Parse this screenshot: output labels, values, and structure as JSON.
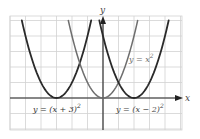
{
  "chart_data": {
    "type": "line",
    "title": "",
    "xlabel": "x",
    "ylabel": "y",
    "xlim": [
      -6,
      5
    ],
    "ylim": [
      -2,
      5.3
    ],
    "grid": true,
    "series": [
      {
        "name": "y = (x + 3)^2",
        "label_text": "y = (x + 3)",
        "exponent": "2",
        "vertex": [
          -3,
          0
        ],
        "shift": -3,
        "color": "#2a2a2a",
        "x_range": [
          -5.236,
          -0.764
        ]
      },
      {
        "name": "y = x^2",
        "label_text": "y = x",
        "exponent": "2",
        "vertex": [
          0,
          0
        ],
        "shift": 0,
        "color": "#6e6e6e",
        "x_range": [
          -2.236,
          2.236
        ]
      },
      {
        "name": "y = (x - 2)^2",
        "label_text": "y = (x − 2)",
        "exponent": "2",
        "vertex": [
          2,
          0
        ],
        "shift": 2,
        "color": "#2a2a2a",
        "x_range": [
          -0.236,
          4.236
        ]
      }
    ]
  },
  "axes": {
    "x_label": "x",
    "y_label": "y"
  },
  "colors": {
    "grid": "#d2d2d2",
    "axis": "#222222",
    "dark_curve": "#2a2a2a",
    "light_curve": "#6e6e6e"
  }
}
